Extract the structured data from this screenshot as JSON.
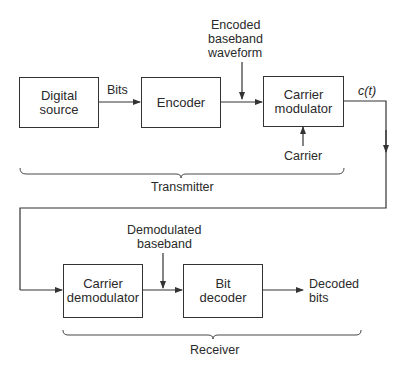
{
  "diagram": {
    "colors": {
      "line": "#333333",
      "text": "#2a2a2a",
      "background": "#ffffff"
    },
    "transmitter": {
      "label": "Transmitter",
      "blocks": [
        {
          "id": "digital-source",
          "line1": "Digital",
          "line2": "source"
        },
        {
          "id": "encoder",
          "line1": "Encoder",
          "line2": ""
        },
        {
          "id": "carrier-modulator",
          "line1": "Carrier",
          "line2": "modulator"
        }
      ],
      "signals": {
        "bits": "Bits",
        "encoded_line1": "Encoded",
        "encoded_line2": "baseband",
        "encoded_line3": "waveform",
        "carrier": "Carrier",
        "output": "c(t)"
      }
    },
    "receiver": {
      "label": "Receiver",
      "blocks": [
        {
          "id": "carrier-demodulator",
          "line1": "Carrier",
          "line2": "demodulator"
        },
        {
          "id": "bit-decoder",
          "line1": "Bit",
          "line2": "decoder"
        }
      ],
      "signals": {
        "demod_line1": "Demodulated",
        "demod_line2": "baseband",
        "decoded_line1": "Decoded",
        "decoded_line2": "bits"
      }
    }
  }
}
